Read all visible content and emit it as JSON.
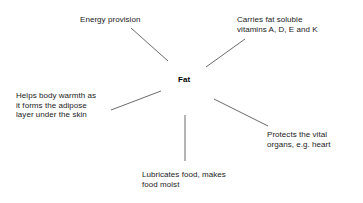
{
  "diagram": {
    "title_text": "Fat",
    "center": {
      "label": "Fat",
      "x": 178,
      "y": 75
    },
    "colors": {
      "background": "#ffffff",
      "text": "#1b1b1b",
      "center_text": "#000000",
      "line": "#5a5a5a"
    },
    "branches": [
      {
        "name": "energy-provision",
        "lines": [
          "Energy provision"
        ],
        "x": 80,
        "y": 15,
        "align": "left"
      },
      {
        "name": "fat-soluble-vitamins",
        "lines": [
          "Carries fat soluble",
          "vitamins A, D, E and K"
        ],
        "x": 237,
        "y": 15,
        "align": "left"
      },
      {
        "name": "body-warmth",
        "lines": [
          "Helps body warmth as",
          "it forms the adipose",
          "layer under the skin"
        ],
        "x": 16,
        "y": 91,
        "align": "left"
      },
      {
        "name": "protects-organs",
        "lines": [
          "Protects the vital",
          "organs, e.g. heart"
        ],
        "x": 267,
        "y": 130,
        "align": "left"
      },
      {
        "name": "lubricates-food",
        "lines": [
          "Lubricates food, makes",
          "food moist"
        ],
        "x": 142,
        "y": 170,
        "align": "left"
      }
    ],
    "connectors": [
      {
        "name": "connector-energy-provision",
        "x1": 131,
        "y1": 28,
        "x2": 168,
        "y2": 61
      },
      {
        "name": "connector-fat-soluble-vitamins",
        "x1": 245,
        "y1": 39,
        "x2": 206,
        "y2": 67
      },
      {
        "name": "connector-body-warmth",
        "x1": 111,
        "y1": 110,
        "x2": 161,
        "y2": 91
      },
      {
        "name": "connector-protects-organs",
        "x1": 214,
        "y1": 99,
        "x2": 268,
        "y2": 126
      },
      {
        "name": "connector-lubricates-food",
        "x1": 185,
        "y1": 115,
        "x2": 185,
        "y2": 161
      }
    ]
  }
}
